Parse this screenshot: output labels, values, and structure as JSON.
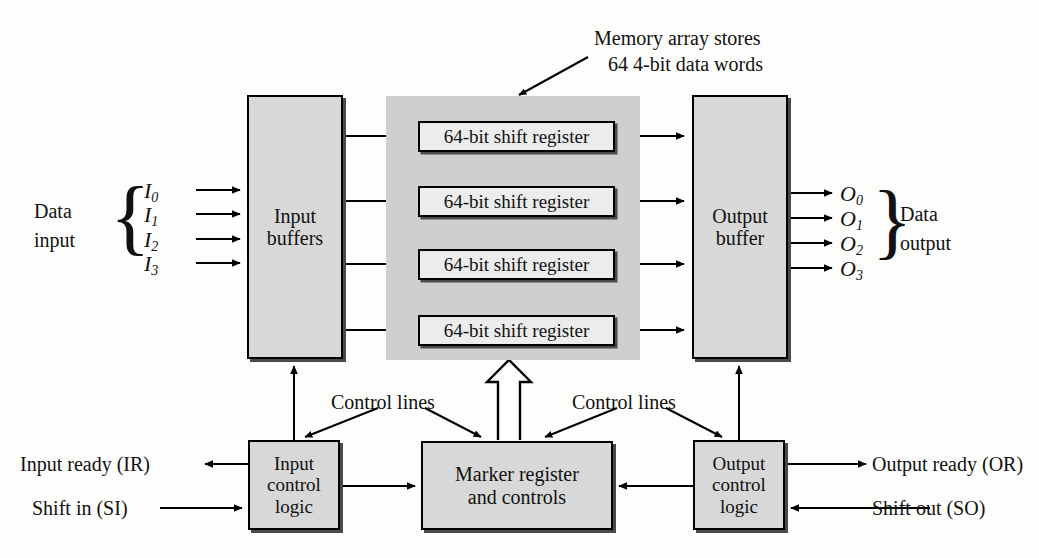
{
  "diagram": {
    "annotation": {
      "line1": "Memory array stores",
      "line2": "64  4-bit data words"
    },
    "blocks": {
      "input_buffers": {
        "line1": "Input",
        "line2": "buffers"
      },
      "output_buffer": {
        "line1": "Output",
        "line2": "buffer"
      },
      "input_control": {
        "line1": "Input",
        "line2": "control",
        "line3": "logic"
      },
      "output_control": {
        "line1": "Output",
        "line2": "control",
        "line3": "logic"
      },
      "marker_register": {
        "line1": "Marker register",
        "line2": "and controls"
      }
    },
    "shift_registers": [
      "64-bit shift register",
      "64-bit shift register",
      "64-bit shift register",
      "64-bit shift register"
    ],
    "data_input": {
      "label_line1": "Data",
      "label_line2": "input",
      "signals": [
        "I",
        "I",
        "I",
        "I"
      ],
      "subscripts": [
        "0",
        "1",
        "2",
        "3"
      ]
    },
    "data_output": {
      "label_line1": "Data",
      "label_line2": "output",
      "signals": [
        "O",
        "O",
        "O",
        "O"
      ],
      "subscripts": [
        "0",
        "1",
        "2",
        "3"
      ]
    },
    "control_line_labels": [
      "Control lines",
      "Control lines"
    ],
    "io_signals": {
      "input_ready": "Input ready (IR)",
      "shift_in": "Shift in (SI)",
      "output_ready": "Output ready (OR)",
      "shift_out": "Shift out (SO)"
    },
    "colors": {
      "block_fill": "#d8d8d8",
      "shift_register_fill": "#ececec",
      "memory_array_fill": "#cfcfcf",
      "stroke": "#000000",
      "page_bg": "#fdfdfb"
    }
  }
}
